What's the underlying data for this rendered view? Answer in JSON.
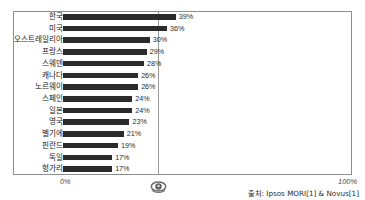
{
  "title_remnant": "",
  "axis": {
    "left_label": "0%",
    "right_label": "100%"
  },
  "source": {
    "text": "출처: Ipsos MORI[1] & Novus[1]"
  },
  "icons": {
    "center": "eye-icon"
  },
  "colors": {
    "bar": "#2b2b2b",
    "frame": "#8d8d8d",
    "gridline": "#9a9a9a",
    "text": "#1a1a1a"
  },
  "chart_data": {
    "type": "bar",
    "orientation": "horizontal",
    "title": "",
    "xlabel": "",
    "ylabel": "",
    "xlim": [
      0,
      100
    ],
    "grid": true,
    "gridlines_at": [
      50
    ],
    "legend": null,
    "categories": [
      "한국",
      "미국",
      "오스트레일리아",
      "프랑스",
      "스웨덴",
      "캐나다",
      "노르웨이",
      "스페인",
      "일본",
      "영국",
      "벨기에",
      "핀란드",
      "독일",
      "헝가리"
    ],
    "values": [
      39,
      36,
      30,
      29,
      28,
      26,
      26,
      24,
      24,
      23,
      21,
      19,
      17,
      17
    ],
    "value_labels": [
      "39%",
      "36%",
      "30%",
      "29%",
      "28%",
      "26%",
      "26%",
      "24%",
      "24%",
      "23%",
      "21%",
      "19%",
      "17%",
      "17%"
    ]
  }
}
